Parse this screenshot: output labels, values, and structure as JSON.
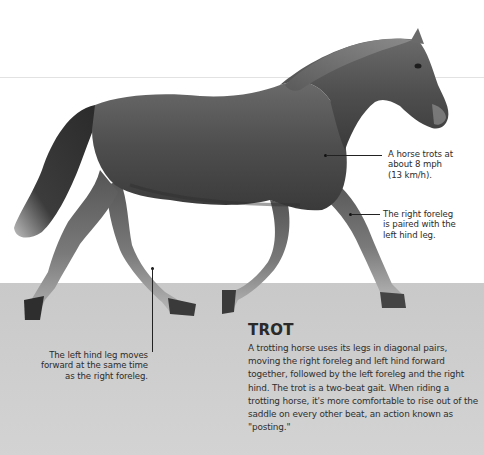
{
  "figure": {
    "title": "TROT",
    "description": "A trotting horse uses its legs in diagonal pairs, moving the right foreleg and left hind forward together, followed by the left foreleg and the right hind. The trot is a two-beat gait. When riding a trotting horse, it's more comfortable to rise out of the saddle on every other beat, an action known as \"posting.\"",
    "image_subject": "horse-trotting"
  },
  "callouts": {
    "speed": {
      "lines": [
        "A horse trots at",
        "about 8 mph",
        "(13 km/h)."
      ]
    },
    "foreleg": {
      "lines": [
        "The right foreleg",
        "is paired with the",
        "left hind leg."
      ]
    },
    "hindleg": {
      "lines": [
        "The left hind leg moves",
        "forward at the same time",
        "as the right foreleg."
      ]
    }
  },
  "colors": {
    "background": "#ffffff",
    "ground": "#cbcbcb",
    "text": "#2b2b2b",
    "horse_body": "#4a4a4a"
  }
}
